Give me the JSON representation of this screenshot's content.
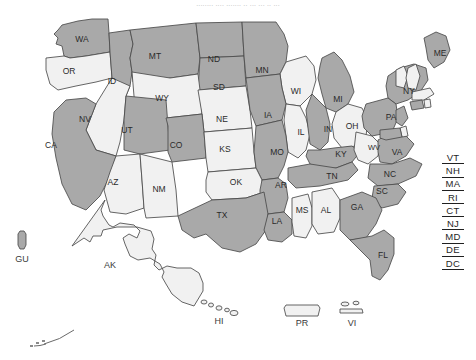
{
  "caption": "........ .... ....... .. ... ... .. ...",
  "colors": {
    "fill_dark": "#a9a9a9",
    "fill_light": "#f1f1f1",
    "stroke": "#4a4a4a",
    "label_text": "#2a2a2a",
    "background": "#ffffff"
  },
  "legend": {
    "dark_meaning": "selected",
    "light_meaning": "not selected"
  },
  "map": {
    "title": "United States map",
    "states": [
      {
        "abbr": "WA",
        "shade": "dark",
        "x": 82,
        "y": 40
      },
      {
        "abbr": "OR",
        "shade": "light",
        "x": 69,
        "y": 72
      },
      {
        "abbr": "ID",
        "shade": "dark",
        "x": 112,
        "y": 82
      },
      {
        "abbr": "MT",
        "shade": "dark",
        "x": 155,
        "y": 57
      },
      {
        "abbr": "ND",
        "shade": "dark",
        "x": 214,
        "y": 60
      },
      {
        "abbr": "SD",
        "shade": "dark",
        "x": 219,
        "y": 88
      },
      {
        "abbr": "MN",
        "shade": "dark",
        "x": 262,
        "y": 71
      },
      {
        "abbr": "WI",
        "shade": "light",
        "x": 296,
        "y": 92
      },
      {
        "abbr": "MI",
        "shade": "dark",
        "x": 338,
        "y": 100
      },
      {
        "abbr": "NY",
        "shade": "dark",
        "x": 409,
        "y": 92
      },
      {
        "abbr": "ME",
        "shade": "dark",
        "x": 440,
        "y": 54
      },
      {
        "abbr": "WY",
        "shade": "light",
        "x": 162,
        "y": 99
      },
      {
        "abbr": "NE",
        "shade": "light",
        "x": 222,
        "y": 120
      },
      {
        "abbr": "IA",
        "shade": "dark",
        "x": 268,
        "y": 116
      },
      {
        "abbr": "IL",
        "shade": "light",
        "x": 301,
        "y": 133
      },
      {
        "abbr": "IN",
        "shade": "dark",
        "x": 328,
        "y": 130
      },
      {
        "abbr": "OH",
        "shade": "light",
        "x": 352,
        "y": 127
      },
      {
        "abbr": "PA",
        "shade": "dark",
        "x": 391,
        "y": 118
      },
      {
        "abbr": "NV",
        "shade": "light",
        "x": 85,
        "y": 120
      },
      {
        "abbr": "UT",
        "shade": "dark",
        "x": 127,
        "y": 131
      },
      {
        "abbr": "CO",
        "shade": "dark",
        "x": 176,
        "y": 146
      },
      {
        "abbr": "KS",
        "shade": "light",
        "x": 225,
        "y": 150
      },
      {
        "abbr": "MO",
        "shade": "dark",
        "x": 277,
        "y": 153
      },
      {
        "abbr": "KY",
        "shade": "dark",
        "x": 341,
        "y": 155
      },
      {
        "abbr": "WV",
        "shade": "light",
        "x": 374,
        "y": 148
      },
      {
        "abbr": "VA",
        "shade": "dark",
        "x": 397,
        "y": 153
      },
      {
        "abbr": "CA",
        "shade": "dark",
        "x": 51,
        "y": 146
      },
      {
        "abbr": "AZ",
        "shade": "light",
        "x": 113,
        "y": 183
      },
      {
        "abbr": "NM",
        "shade": "light",
        "x": 159,
        "y": 190
      },
      {
        "abbr": "OK",
        "shade": "light",
        "x": 236,
        "y": 183
      },
      {
        "abbr": "AR",
        "shade": "dark",
        "x": 281,
        "y": 186
      },
      {
        "abbr": "TN",
        "shade": "dark",
        "x": 332,
        "y": 177
      },
      {
        "abbr": "NC",
        "shade": "dark",
        "x": 390,
        "y": 175
      },
      {
        "abbr": "SC",
        "shade": "dark",
        "x": 382,
        "y": 192
      },
      {
        "abbr": "TX",
        "shade": "dark",
        "x": 222,
        "y": 216
      },
      {
        "abbr": "LA",
        "shade": "dark",
        "x": 277,
        "y": 222
      },
      {
        "abbr": "MS",
        "shade": "light",
        "x": 302,
        "y": 211
      },
      {
        "abbr": "AL",
        "shade": "light",
        "x": 326,
        "y": 211
      },
      {
        "abbr": "GA",
        "shade": "dark",
        "x": 357,
        "y": 208
      },
      {
        "abbr": "FL",
        "shade": "dark",
        "x": 383,
        "y": 256
      }
    ],
    "territories": [
      {
        "abbr": "GU",
        "shade": "dark",
        "label_x": 22,
        "label_y": 260
      },
      {
        "abbr": "AK",
        "shade": "light",
        "label_x": 110,
        "label_y": 266
      },
      {
        "abbr": "HI",
        "shade": "light",
        "label_x": 219,
        "label_y": 322
      },
      {
        "abbr": "PR",
        "shade": "light",
        "label_x": 302,
        "label_y": 324
      },
      {
        "abbr": "VI",
        "shade": "light",
        "label_x": 352,
        "label_y": 324
      }
    ]
  },
  "side_list": {
    "name": "small-states-list",
    "items": [
      "VT",
      "NH",
      "MA",
      "RI",
      "CT",
      "NJ",
      "MD",
      "DE",
      "DC"
    ]
  }
}
